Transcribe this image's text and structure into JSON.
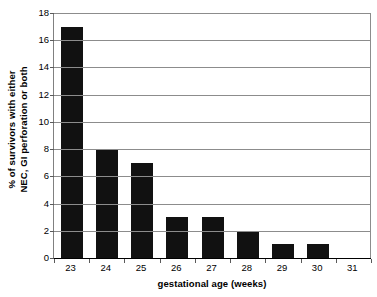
{
  "chart_data": {
    "type": "bar",
    "title": "",
    "subtitle": "",
    "xlabel": "gestational age (weeks)",
    "ylabel_lines": [
      "% of survivors with either",
      "NEC, GI perforation or both"
    ],
    "ylabel": "% of survivors with either NEC, GI perforation or both",
    "categories": [
      "23",
      "24",
      "25",
      "26",
      "27",
      "28",
      "29",
      "30",
      "31"
    ],
    "values": [
      17,
      8,
      7,
      3,
      3,
      2,
      1,
      1,
      0
    ],
    "ylim": [
      0,
      18
    ],
    "ytick_step": 2,
    "yticks": [
      0,
      2,
      4,
      6,
      8,
      10,
      12,
      14,
      16,
      18
    ],
    "ytick_labels": [
      "0",
      "2",
      "4",
      "6",
      "8",
      "10",
      "12",
      "14",
      "16",
      "18"
    ],
    "grid": "horizontal",
    "legend": "none",
    "bar_color": "#111111",
    "gridline_color": "#8c8c8c",
    "axis_color": "#000000",
    "background_color": "#ffffff",
    "annotations": []
  }
}
